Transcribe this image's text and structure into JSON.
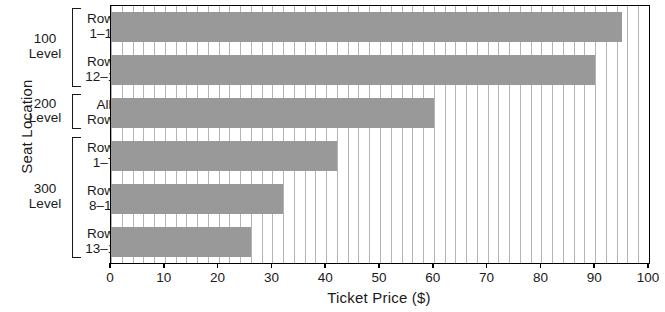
{
  "chart_data": {
    "type": "bar",
    "orientation": "horizontal",
    "title": "",
    "xlabel": "Ticket Price ($)",
    "ylabel": "Seat Location",
    "xlim": [
      0,
      100
    ],
    "xticks": [
      "0",
      "10",
      "20",
      "30",
      "40",
      "50",
      "60",
      "70",
      "80",
      "90",
      "100"
    ],
    "grid": "vertical-minor",
    "legend": "none",
    "bar_color": "#999999",
    "axis_color": "#000000",
    "gridline_color": "#b4b4b4",
    "categories": [
      "Rows 1–11",
      "Rows 12–19",
      "All Rows",
      "Rows 1–7",
      "Rows 8–12",
      "Rows 13–17"
    ],
    "values": [
      95,
      90,
      60,
      42,
      32,
      26
    ],
    "groups": [
      {
        "label_line1": "100",
        "label_line2": "Level",
        "categories": [
          "Rows 1–11",
          "Rows 12–19"
        ]
      },
      {
        "label_line1": "200",
        "label_line2": "Level",
        "categories": [
          "All Rows"
        ]
      },
      {
        "label_line1": "300",
        "label_line2": "Level",
        "categories": [
          "Rows 1–7",
          "Rows 8–12",
          "Rows 13–17"
        ]
      }
    ]
  },
  "axes": {
    "y_title": "Seat Location",
    "x_title": "Ticket Price ($)"
  },
  "groups": [
    {
      "line1": "100",
      "line2": "Level"
    },
    {
      "line1": "200",
      "line2": "Level"
    },
    {
      "line1": "300",
      "line2": "Level"
    }
  ],
  "bars": [
    {
      "line1": "Rows",
      "line2": "1–11",
      "value": 95
    },
    {
      "line1": "Rows",
      "line2": "12–19",
      "value": 90
    },
    {
      "line1": "All",
      "line2": "Rows",
      "value": 60
    },
    {
      "line1": "Rows",
      "line2": "1–7",
      "value": 42
    },
    {
      "line1": "Rows",
      "line2": "8–12",
      "value": 32
    },
    {
      "line1": "Rows",
      "line2": "13–17",
      "value": 26
    }
  ],
  "xticks": [
    {
      "label": "0",
      "value": 0
    },
    {
      "label": "10",
      "value": 10
    },
    {
      "label": "20",
      "value": 20
    },
    {
      "label": "30",
      "value": 30
    },
    {
      "label": "40",
      "value": 40
    },
    {
      "label": "50",
      "value": 50
    },
    {
      "label": "60",
      "value": 60
    },
    {
      "label": "70",
      "value": 70
    },
    {
      "label": "80",
      "value": 80
    },
    {
      "label": "90",
      "value": 90
    },
    {
      "label": "100",
      "value": 100
    }
  ]
}
